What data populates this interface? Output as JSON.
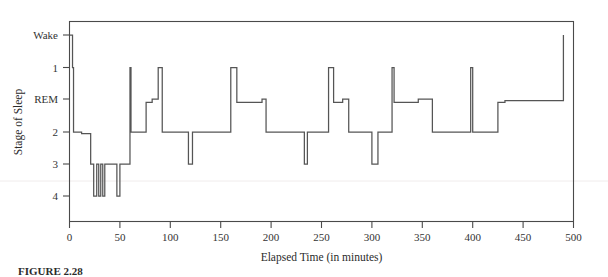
{
  "figure": {
    "caption_label": "FIGURE 2.28",
    "background_color": "#ffffff",
    "trace_color": "#555555",
    "axis_color": "#4a4a4a"
  },
  "axes": {
    "y_title": "Stage of Sleep",
    "x_title": "Elapsed Time (in minutes)",
    "y_tick_labels": [
      "Wake",
      "1",
      "REM",
      "2",
      "3",
      "4"
    ],
    "x_tick_labels": [
      "0",
      "50",
      "100",
      "150",
      "200",
      "250",
      "300",
      "350",
      "400",
      "450",
      "500"
    ]
  },
  "chart_data": {
    "type": "line",
    "title": "",
    "subtitle": "",
    "xlabel": "Elapsed Time (in minutes)",
    "ylabel": "Stage of Sleep",
    "xlim": [
      -5,
      500
    ],
    "ylim": [
      0,
      5
    ],
    "grid": false,
    "legend": null,
    "step_interpolation": "post",
    "y_categories": [
      "Wake",
      "1",
      "REM",
      "2",
      "3",
      "4"
    ],
    "y_category_values": [
      0,
      1,
      2,
      3,
      4,
      5
    ],
    "x_ticks": [
      0,
      50,
      100,
      150,
      200,
      250,
      300,
      350,
      400,
      450,
      500
    ],
    "series": [
      {
        "name": "Sleep stage",
        "x": [
          0,
          3,
          3,
          4,
          4,
          12,
          12,
          21,
          21,
          24,
          24,
          27,
          27,
          29,
          29,
          31,
          31,
          33,
          33,
          35,
          35,
          38,
          38,
          41,
          41,
          47,
          47,
          50,
          50,
          53,
          53,
          60,
          60,
          61,
          61,
          76,
          76,
          82,
          82,
          88,
          88,
          92,
          92,
          118,
          118,
          122,
          122,
          127,
          127,
          160,
          160,
          166,
          166,
          191,
          191,
          195,
          195,
          225,
          225,
          233,
          233,
          236,
          236,
          238,
          238,
          257,
          257,
          262,
          262,
          271,
          271,
          277,
          277,
          300,
          300,
          306,
          306,
          320,
          320,
          322,
          322,
          346,
          346,
          360,
          360,
          370,
          370,
          398,
          398,
          400,
          400,
          425,
          425,
          432,
          432,
          490,
          490,
          493
        ],
        "y_stage_values": [
          0,
          0,
          1,
          1,
          3,
          3,
          3.05,
          3.05,
          4,
          4,
          5,
          5,
          4,
          4,
          5,
          5,
          4,
          4,
          5,
          5,
          4,
          4,
          4,
          4,
          4,
          4,
          5,
          5,
          4,
          4,
          4,
          4,
          1,
          1,
          3,
          3,
          2.1,
          2.1,
          2,
          2,
          1,
          1,
          3,
          3,
          4,
          4,
          3,
          3,
          3,
          3,
          1,
          1,
          2.1,
          2.1,
          2,
          2,
          3,
          3,
          3,
          3,
          4,
          4,
          3,
          3,
          3,
          3,
          1,
          1,
          2.1,
          2.1,
          2,
          2,
          3,
          3,
          4,
          4,
          3,
          3,
          1,
          1,
          2.1,
          2.1,
          2,
          2,
          3,
          3,
          3,
          3,
          1,
          1,
          3,
          3,
          2.1,
          2.1,
          2.05,
          2.05,
          0
        ],
        "description_stages": "Wake=0, Stage1=1, REM=2, Stage2=3, Stage3=4, Stage4=5"
      }
    ],
    "annotations": []
  }
}
